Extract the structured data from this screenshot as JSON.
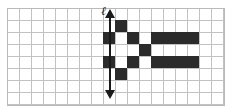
{
  "figure": {
    "background_color": "#ffffff"
  },
  "grid": {
    "columns": 18,
    "rows": 8,
    "cell_size_px": 12,
    "origin_x_px": 7,
    "origin_y_px": 8,
    "line_color": "#c2c2c2",
    "border_color": "#b9b9b9",
    "fill_color": "#ffffff"
  },
  "axis": {
    "label": "ℓ",
    "orientation": "vertical",
    "double_headed": true,
    "color": "#1a1a1a",
    "x_px": 110,
    "top_px": 9,
    "bottom_px": 99,
    "at_grid_column_boundary": 8.5
  },
  "shaded_cells": {
    "color": "#2b2b2b",
    "count": 16,
    "cells": [
      {
        "col": 9,
        "row": 1
      },
      {
        "col": 8,
        "row": 2
      },
      {
        "col": 10,
        "row": 2
      },
      {
        "col": 12,
        "row": 2
      },
      {
        "col": 13,
        "row": 2
      },
      {
        "col": 14,
        "row": 2
      },
      {
        "col": 15,
        "row": 2
      },
      {
        "col": 11,
        "row": 3
      },
      {
        "col": 8,
        "row": 4
      },
      {
        "col": 10,
        "row": 4
      },
      {
        "col": 12,
        "row": 4
      },
      {
        "col": 13,
        "row": 4
      },
      {
        "col": 14,
        "row": 4
      },
      {
        "col": 15,
        "row": 4
      },
      {
        "col": 9,
        "row": 5
      }
    ]
  }
}
